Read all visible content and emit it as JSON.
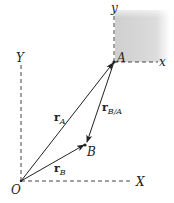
{
  "diagram": {
    "type": "relative-position-vectors",
    "labels": {
      "origin": "O",
      "X_axis": "X",
      "Y_axis": "Y",
      "point_A": "A",
      "point_B": "B",
      "x_axis_local": "x",
      "y_axis_local": "y"
    },
    "vectors": [
      {
        "name": "r_A",
        "main": "r",
        "sub": "A",
        "from": "O",
        "to": "A"
      },
      {
        "name": "r_B",
        "main": "r",
        "sub": "B",
        "from": "O",
        "to": "B"
      },
      {
        "name": "r_B/A",
        "main": "r",
        "sub": "B/A",
        "from": "A",
        "to": "B"
      }
    ],
    "colors": {
      "line": "#222222",
      "shade": "#d4d4d4"
    }
  }
}
